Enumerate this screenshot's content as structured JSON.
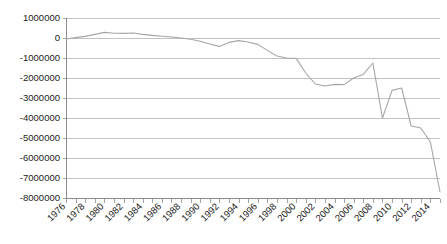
{
  "chart_data": {
    "type": "line",
    "title": "",
    "subtitle": "",
    "xlabel": "",
    "ylabel": "",
    "grid": true,
    "legend": false,
    "legend_position": "none",
    "line_color": "#a6a6a6",
    "gridline_color": "#b3b3b3",
    "axis_color": "#8c8c8c",
    "text_color": "#1a1a1a",
    "background_color": "#ffffff",
    "xlim": [
      1976,
      2015
    ],
    "ylim": [
      -8000000,
      1000000
    ],
    "y_tick_step": 1000000,
    "x_tick_step": 1,
    "x_label_step": 2,
    "x_label_rotation": -45,
    "y_tick_labels": [
      "1000000",
      "0",
      "-1000000",
      "-2000000",
      "-3000000",
      "-4000000",
      "-5000000",
      "-6000000",
      "-7000000",
      "-8000000"
    ],
    "y_tick_values": [
      1000000,
      0,
      -1000000,
      -2000000,
      -3000000,
      -4000000,
      -5000000,
      -6000000,
      -7000000,
      -8000000
    ],
    "x_tick_labels": [
      "1976",
      "1978",
      "1980",
      "1982",
      "1984",
      "1986",
      "1988",
      "1990",
      "1992",
      "1994",
      "1996",
      "1998",
      "2000",
      "2002",
      "2004",
      "2006",
      "2008",
      "2010",
      "2012",
      "2014"
    ],
    "x_tick_values": [
      1976,
      1978,
      1980,
      1982,
      1984,
      1986,
      1988,
      1990,
      1992,
      1994,
      1996,
      1998,
      2000,
      2002,
      2004,
      2006,
      2008,
      2010,
      2012,
      2014
    ],
    "x": [
      1976,
      1977,
      1978,
      1979,
      1980,
      1981,
      1982,
      1983,
      1984,
      1985,
      1986,
      1987,
      1988,
      1989,
      1990,
      1991,
      1992,
      1993,
      1994,
      1995,
      1996,
      1997,
      1998,
      1999,
      2000,
      2001,
      2002,
      2003,
      2004,
      2005,
      2006,
      2007,
      2008,
      2009,
      2010,
      2011,
      2012,
      2013,
      2014,
      2015
    ],
    "values": [
      -50000,
      20000,
      80000,
      180000,
      280000,
      240000,
      230000,
      250000,
      180000,
      130000,
      90000,
      50000,
      0,
      -60000,
      -160000,
      -300000,
      -420000,
      -220000,
      -130000,
      -200000,
      -320000,
      -620000,
      -900000,
      -1000000,
      -1020000,
      -1750000,
      -2300000,
      -2400000,
      -2320000,
      -2330000,
      -2000000,
      -1820000,
      -1250000,
      -4000000,
      -2620000,
      -2500000,
      -4400000,
      -4500000,
      -5200000,
      -7700000
    ],
    "series": [
      {
        "name": "series-1",
        "values": [
          -50000,
          20000,
          80000,
          180000,
          280000,
          240000,
          230000,
          250000,
          180000,
          130000,
          90000,
          50000,
          0,
          -60000,
          -160000,
          -300000,
          -420000,
          -220000,
          -130000,
          -200000,
          -320000,
          -620000,
          -900000,
          -1000000,
          -1020000,
          -1750000,
          -2300000,
          -2400000,
          -2320000,
          -2330000,
          -2000000,
          -1820000,
          -1250000,
          -4000000,
          -2620000,
          -2500000,
          -4400000,
          -4500000,
          -5200000,
          -7700000
        ]
      }
    ],
    "annotations": []
  }
}
